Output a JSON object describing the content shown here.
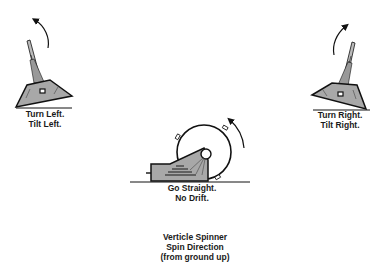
{
  "figures": {
    "left": {
      "line1": "Turn Left.",
      "line2": "Tilt Left."
    },
    "right": {
      "line1": "Turn Right.",
      "line2": "Tilt Right."
    },
    "center": {
      "line1": "Go Straight.",
      "line2": "No Drift."
    }
  },
  "caption": {
    "line1": "Verticle Spinner",
    "line2": "Spin Direction",
    "line3": "(from ground up)"
  },
  "colors": {
    "body_fill": "#a8a8a8",
    "stroke": "#111111",
    "background": "#ffffff"
  },
  "icons": {
    "left_arrow": "curved-arrow-counterclockwise",
    "right_arrow": "curved-arrow-clockwise",
    "center_arrow": "curved-arrow-spin"
  }
}
